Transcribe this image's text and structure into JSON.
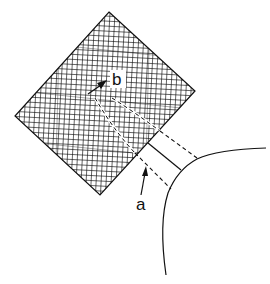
{
  "figure": {
    "type": "schematic diagram",
    "labels": {
      "a": "a",
      "b": "b"
    },
    "colors": {
      "stroke": "#111111",
      "background": "#ffffff"
    }
  }
}
